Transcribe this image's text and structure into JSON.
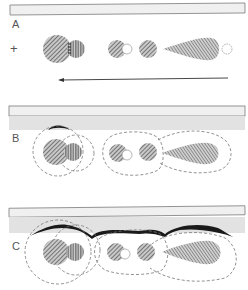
{
  "figure": {
    "panels": [
      {
        "label": "A",
        "description": "Particles in free solution with electrode plus sign and arrow indicating direction of migration"
      },
      {
        "label": "B",
        "description": "Particles with dashed diffuse layers approaching surface"
      },
      {
        "label": "C",
        "description": "Particles with expanded dashed layers adsorbed/contacting surface with dark deposit"
      }
    ],
    "electrode_symbol": "+",
    "arrow_direction": "left",
    "colors": {
      "hatch": "#6f6f6f",
      "surface_fill": "#e8e8e8",
      "surface_border": "#888888",
      "shadow_band": "#dcdcdc",
      "dashed": "#777777",
      "deposit": "#1a1a1a"
    }
  }
}
